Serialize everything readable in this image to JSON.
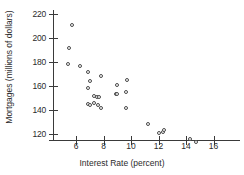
{
  "chart_data": {
    "type": "scatter",
    "title": "",
    "xlabel": "Interest Rate (percent)",
    "ylabel": "Mortgages (millions of dollars)",
    "xlim": [
      4.6,
      16.6
    ],
    "ylim": [
      110,
      226
    ],
    "xticks": [
      6,
      8,
      10,
      12,
      14,
      16
    ],
    "yticks": [
      120,
      140,
      160,
      180,
      200,
      220
    ],
    "grid": false,
    "legend": null,
    "marker": "open-circle",
    "points": [
      {
        "x": 5.7,
        "y": 211
      },
      {
        "x": 5.5,
        "y": 192
      },
      {
        "x": 5.4,
        "y": 178
      },
      {
        "x": 6.3,
        "y": 177
      },
      {
        "x": 6.9,
        "y": 172
      },
      {
        "x": 7.0,
        "y": 164
      },
      {
        "x": 6.9,
        "y": 158
      },
      {
        "x": 7.8,
        "y": 168
      },
      {
        "x": 7.3,
        "y": 152
      },
      {
        "x": 7.5,
        "y": 151
      },
      {
        "x": 7.7,
        "y": 151
      },
      {
        "x": 6.9,
        "y": 145
      },
      {
        "x": 7.0,
        "y": 144
      },
      {
        "x": 7.3,
        "y": 146
      },
      {
        "x": 7.6,
        "y": 144
      },
      {
        "x": 7.8,
        "y": 142
      },
      {
        "x": 9.0,
        "y": 161
      },
      {
        "x": 9.7,
        "y": 165
      },
      {
        "x": 9.6,
        "y": 155
      },
      {
        "x": 8.9,
        "y": 153
      },
      {
        "x": 9.0,
        "y": 153
      },
      {
        "x": 9.6,
        "y": 142
      },
      {
        "x": 11.2,
        "y": 128
      },
      {
        "x": 12.0,
        "y": 121
      },
      {
        "x": 12.3,
        "y": 122
      },
      {
        "x": 12.4,
        "y": 123
      },
      {
        "x": 14.3,
        "y": 116
      },
      {
        "x": 14.7,
        "y": 113
      }
    ]
  },
  "axes": {
    "x_title": "Interest Rate (percent)",
    "y_title": "Mortgages (millions of dollars)",
    "x_tick_labels": [
      "6",
      "8",
      "10",
      "12",
      "14",
      "16"
    ],
    "y_tick_labels": [
      "120",
      "140",
      "160",
      "180",
      "200",
      "220"
    ]
  }
}
